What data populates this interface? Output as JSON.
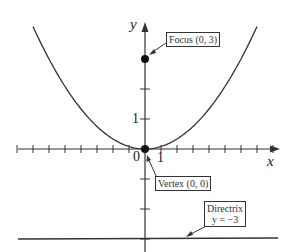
{
  "diagram": {
    "axes": {
      "x_label": "x",
      "y_label": "y",
      "origin_label": "0",
      "x_tick_label": "1",
      "y_tick_label": "1",
      "x_ticks": [
        -8,
        -7,
        -6,
        -5,
        -4,
        -3,
        -2,
        -1,
        1,
        2,
        3,
        4,
        5,
        6,
        7,
        8
      ],
      "y_ticks": [
        -3,
        -2,
        -1,
        1,
        2
      ]
    },
    "curve": {
      "type": "parabola",
      "equation": "x^2 = 12y",
      "x_range": [
        -7,
        7
      ]
    },
    "annotations": {
      "focus": {
        "label": "Focus (0, 3)",
        "point": [
          0,
          3
        ]
      },
      "vertex": {
        "label": "Vertex (0, 0)",
        "point": [
          0,
          0
        ]
      },
      "directrix": {
        "label_line1": "Directrix",
        "label_line2": "y = −3",
        "y": -3
      }
    },
    "colors": {
      "line": "#333333",
      "point": "#111111",
      "background": "#ffffff"
    }
  }
}
